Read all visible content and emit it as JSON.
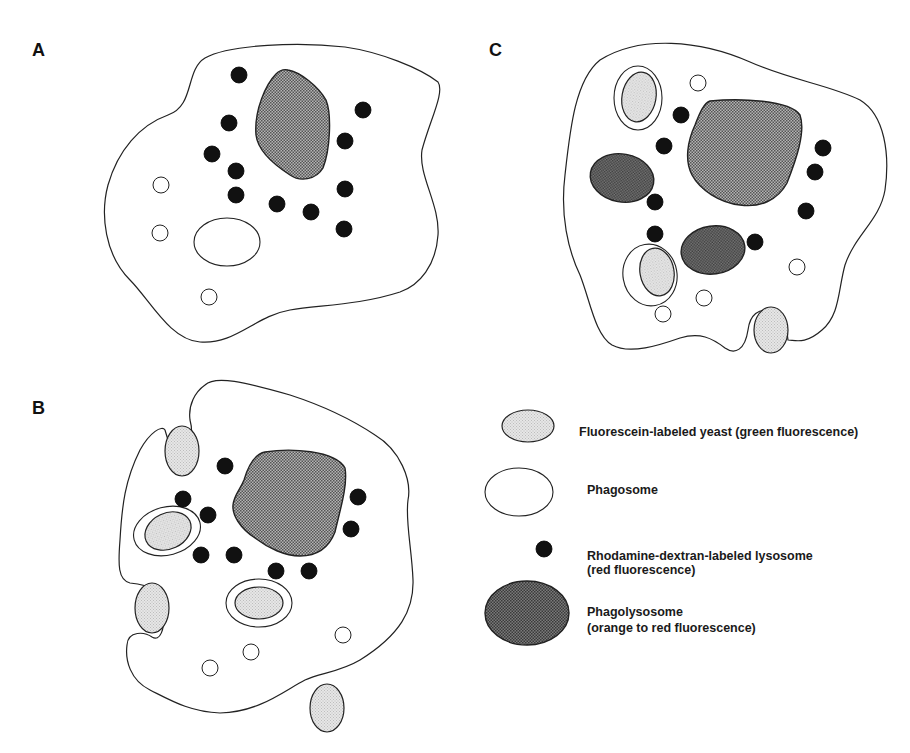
{
  "panels": {
    "a": {
      "label": "A"
    },
    "b": {
      "label": "B"
    },
    "c": {
      "label": "C"
    }
  },
  "legend": {
    "items": [
      {
        "key": "yeast",
        "line1": "Fluorescein-labeled yeast (green fluorescence)",
        "line2": ""
      },
      {
        "key": "phagosome",
        "line1": "Phagosome",
        "line2": ""
      },
      {
        "key": "lysosome",
        "line1": "Rhodamine-dextran-labeled lysosome",
        "line2": "(red fluorescence)"
      },
      {
        "key": "phagolysosome",
        "line1": "Phagolysosome",
        "line2": "(orange to red fluorescence)"
      }
    ]
  },
  "colors": {
    "outline": "#222222",
    "nucleus_fill": "#8c8c8c",
    "yeast_fill": "#dcdcdc",
    "lysosome_fill": "#111111",
    "phagolysosome_fill": "#5a5a5a",
    "background": "#ffffff"
  }
}
